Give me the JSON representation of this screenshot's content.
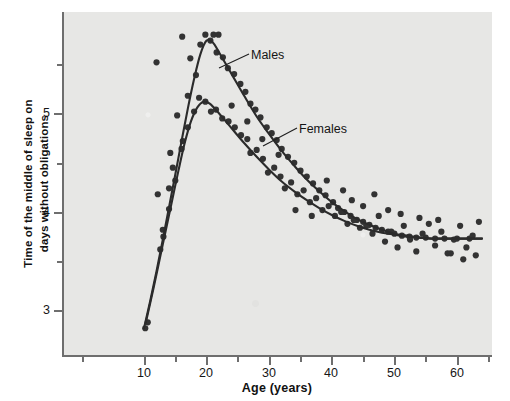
{
  "chart_data": {
    "type": "scatter",
    "title": "",
    "xlabel": "Age (years)",
    "ylabel": "Time of the middle of sleep on days without obligations",
    "xlim": [
      6,
      66
    ],
    "ylim": [
      2.6,
      6.0
    ],
    "xticks_major": [
      10,
      20,
      30,
      40,
      50,
      60
    ],
    "xticks_minor": [
      5,
      15,
      25,
      35,
      45,
      55,
      65
    ],
    "yticks_major": [
      3,
      4,
      5
    ],
    "yticks_minor": [
      3.5,
      4.5,
      5.5
    ],
    "grid": false,
    "legend_position": "inline-annotations",
    "annotations": [
      {
        "text": "Males",
        "x": 26.5,
        "y": 5.45
      },
      {
        "text": "Females",
        "x": 34.0,
        "y": 4.7
      }
    ],
    "series": [
      {
        "name": "Males",
        "fit_points": [
          {
            "x": 10.0,
            "y": 2.82
          },
          {
            "x": 11.0,
            "y": 3.1
          },
          {
            "x": 12.0,
            "y": 3.4
          },
          {
            "x": 13.0,
            "y": 3.72
          },
          {
            "x": 14.0,
            "y": 4.05
          },
          {
            "x": 15.0,
            "y": 4.38
          },
          {
            "x": 16.0,
            "y": 4.72
          },
          {
            "x": 17.0,
            "y": 5.05
          },
          {
            "x": 18.0,
            "y": 5.35
          },
          {
            "x": 19.0,
            "y": 5.6
          },
          {
            "x": 20.0,
            "y": 5.74
          },
          {
            "x": 21.0,
            "y": 5.72
          },
          {
            "x": 22.0,
            "y": 5.62
          },
          {
            "x": 24.0,
            "y": 5.4
          },
          {
            "x": 26.0,
            "y": 5.18
          },
          {
            "x": 28.0,
            "y": 4.97
          },
          {
            "x": 30.0,
            "y": 4.79
          },
          {
            "x": 32.0,
            "y": 4.62
          },
          {
            "x": 34.0,
            "y": 4.47
          },
          {
            "x": 36.0,
            "y": 4.33
          },
          {
            "x": 38.0,
            "y": 4.21
          },
          {
            "x": 40.0,
            "y": 4.1
          },
          {
            "x": 42.0,
            "y": 4.01
          },
          {
            "x": 44.0,
            "y": 3.93
          },
          {
            "x": 46.0,
            "y": 3.87
          },
          {
            "x": 48.0,
            "y": 3.82
          },
          {
            "x": 50.0,
            "y": 3.78
          },
          {
            "x": 52.0,
            "y": 3.76
          },
          {
            "x": 54.0,
            "y": 3.74
          },
          {
            "x": 56.0,
            "y": 3.73
          },
          {
            "x": 58.0,
            "y": 3.73
          },
          {
            "x": 60.0,
            "y": 3.73
          },
          {
            "x": 62.0,
            "y": 3.73
          },
          {
            "x": 64.0,
            "y": 3.73
          }
        ],
        "points": [
          {
            "x": 10.2,
            "y": 2.82
          },
          {
            "x": 10.6,
            "y": 2.88
          },
          {
            "x": 12.6,
            "y": 3.62
          },
          {
            "x": 13.1,
            "y": 3.75
          },
          {
            "x": 14.0,
            "y": 4.03
          },
          {
            "x": 14.0,
            "y": 4.24
          },
          {
            "x": 14.6,
            "y": 4.45
          },
          {
            "x": 15.3,
            "y": 4.98
          },
          {
            "x": 16.2,
            "y": 4.72
          },
          {
            "x": 17.0,
            "y": 5.18
          },
          {
            "x": 17.4,
            "y": 5.56
          },
          {
            "x": 18.3,
            "y": 5.39
          },
          {
            "x": 19.0,
            "y": 5.7
          },
          {
            "x": 19.8,
            "y": 5.8
          },
          {
            "x": 20.6,
            "y": 5.74
          },
          {
            "x": 21.1,
            "y": 5.8
          },
          {
            "x": 21.6,
            "y": 5.62
          },
          {
            "x": 22.6,
            "y": 5.57
          },
          {
            "x": 23.4,
            "y": 5.46
          },
          {
            "x": 24.4,
            "y": 5.4
          },
          {
            "x": 25.4,
            "y": 5.3
          },
          {
            "x": 26.2,
            "y": 5.22
          },
          {
            "x": 27.0,
            "y": 5.1
          },
          {
            "x": 27.8,
            "y": 5.04
          },
          {
            "x": 28.6,
            "y": 4.96
          },
          {
            "x": 29.6,
            "y": 4.86
          },
          {
            "x": 30.4,
            "y": 4.8
          },
          {
            "x": 31.2,
            "y": 4.73
          },
          {
            "x": 32.0,
            "y": 4.64
          },
          {
            "x": 33.0,
            "y": 4.56
          },
          {
            "x": 34.0,
            "y": 4.5
          },
          {
            "x": 35.0,
            "y": 4.42
          },
          {
            "x": 36.0,
            "y": 4.36
          },
          {
            "x": 37.0,
            "y": 4.29
          },
          {
            "x": 38.0,
            "y": 4.22
          },
          {
            "x": 39.0,
            "y": 4.17
          },
          {
            "x": 40.2,
            "y": 4.1
          },
          {
            "x": 41.0,
            "y": 4.04
          },
          {
            "x": 42.0,
            "y": 4.0
          },
          {
            "x": 43.0,
            "y": 3.96
          },
          {
            "x": 44.0,
            "y": 3.92
          },
          {
            "x": 45.0,
            "y": 3.9
          },
          {
            "x": 46.0,
            "y": 3.87
          },
          {
            "x": 47.0,
            "y": 3.84
          },
          {
            "x": 48.0,
            "y": 3.82
          },
          {
            "x": 49.0,
            "y": 3.8
          },
          {
            "x": 50.0,
            "y": 3.78
          },
          {
            "x": 51.2,
            "y": 3.76
          },
          {
            "x": 52.4,
            "y": 3.75
          },
          {
            "x": 53.5,
            "y": 3.74
          },
          {
            "x": 55.0,
            "y": 3.74
          },
          {
            "x": 56.5,
            "y": 3.73
          },
          {
            "x": 58.0,
            "y": 3.73
          },
          {
            "x": 60.0,
            "y": 3.73
          },
          {
            "x": 62.0,
            "y": 3.73
          }
        ]
      },
      {
        "name": "Females",
        "fit_points": [
          {
            "x": 10.3,
            "y": 2.88
          },
          {
            "x": 11.5,
            "y": 3.22
          },
          {
            "x": 12.5,
            "y": 3.52
          },
          {
            "x": 13.5,
            "y": 3.82
          },
          {
            "x": 14.5,
            "y": 4.12
          },
          {
            "x": 15.5,
            "y": 4.42
          },
          {
            "x": 16.5,
            "y": 4.7
          },
          {
            "x": 17.5,
            "y": 4.92
          },
          {
            "x": 18.5,
            "y": 5.06
          },
          {
            "x": 19.5,
            "y": 5.12
          },
          {
            "x": 20.5,
            "y": 5.1
          },
          {
            "x": 22.0,
            "y": 5.0
          },
          {
            "x": 24.0,
            "y": 4.85
          },
          {
            "x": 26.0,
            "y": 4.7
          },
          {
            "x": 28.0,
            "y": 4.56
          },
          {
            "x": 30.0,
            "y": 4.43
          },
          {
            "x": 32.0,
            "y": 4.31
          },
          {
            "x": 34.0,
            "y": 4.21
          },
          {
            "x": 36.0,
            "y": 4.12
          },
          {
            "x": 38.0,
            "y": 4.04
          },
          {
            "x": 40.0,
            "y": 3.97
          },
          {
            "x": 42.0,
            "y": 3.91
          },
          {
            "x": 44.0,
            "y": 3.86
          },
          {
            "x": 46.0,
            "y": 3.82
          },
          {
            "x": 48.0,
            "y": 3.79
          },
          {
            "x": 50.0,
            "y": 3.77
          },
          {
            "x": 52.0,
            "y": 3.75
          },
          {
            "x": 54.0,
            "y": 3.74
          },
          {
            "x": 56.0,
            "y": 3.73
          },
          {
            "x": 58.0,
            "y": 3.73
          },
          {
            "x": 60.0,
            "y": 3.73
          },
          {
            "x": 62.0,
            "y": 3.73
          },
          {
            "x": 64.0,
            "y": 3.73
          }
        ],
        "points": [
          {
            "x": 12.2,
            "y": 4.18
          },
          {
            "x": 13.0,
            "y": 3.82
          },
          {
            "x": 14.2,
            "y": 4.6
          },
          {
            "x": 15.0,
            "y": 4.32
          },
          {
            "x": 16.0,
            "y": 4.64
          },
          {
            "x": 17.0,
            "y": 4.86
          },
          {
            "x": 18.0,
            "y": 5.02
          },
          {
            "x": 18.8,
            "y": 5.16
          },
          {
            "x": 19.8,
            "y": 5.12
          },
          {
            "x": 20.7,
            "y": 5.02
          },
          {
            "x": 21.5,
            "y": 5.04
          },
          {
            "x": 22.5,
            "y": 4.95
          },
          {
            "x": 23.5,
            "y": 4.92
          },
          {
            "x": 24.5,
            "y": 4.86
          },
          {
            "x": 25.5,
            "y": 4.78
          },
          {
            "x": 26.5,
            "y": 4.74
          },
          {
            "x": 27.0,
            "y": 4.6
          },
          {
            "x": 28.0,
            "y": 4.63
          },
          {
            "x": 29.0,
            "y": 4.54
          },
          {
            "x": 29.8,
            "y": 4.4
          },
          {
            "x": 30.8,
            "y": 4.45
          },
          {
            "x": 31.8,
            "y": 4.36
          },
          {
            "x": 32.5,
            "y": 4.24
          },
          {
            "x": 33.5,
            "y": 4.3
          },
          {
            "x": 34.5,
            "y": 4.18
          },
          {
            "x": 35.5,
            "y": 4.22
          },
          {
            "x": 36.5,
            "y": 4.1
          },
          {
            "x": 37.5,
            "y": 4.14
          },
          {
            "x": 38.5,
            "y": 4.02
          },
          {
            "x": 39.5,
            "y": 4.06
          },
          {
            "x": 40.5,
            "y": 3.96
          },
          {
            "x": 41.5,
            "y": 4.0
          },
          {
            "x": 42.5,
            "y": 3.88
          },
          {
            "x": 43.5,
            "y": 3.92
          },
          {
            "x": 44.5,
            "y": 3.84
          },
          {
            "x": 45.5,
            "y": 3.86
          },
          {
            "x": 46.5,
            "y": 3.78
          },
          {
            "x": 47.5,
            "y": 3.96
          },
          {
            "x": 48.5,
            "y": 3.7
          },
          {
            "x": 49.5,
            "y": 3.8
          },
          {
            "x": 50.5,
            "y": 3.64
          },
          {
            "x": 51.5,
            "y": 3.86
          },
          {
            "x": 52.5,
            "y": 3.72
          },
          {
            "x": 53.5,
            "y": 3.6
          },
          {
            "x": 54.5,
            "y": 3.78
          },
          {
            "x": 55.5,
            "y": 3.88
          },
          {
            "x": 56.5,
            "y": 3.66
          },
          {
            "x": 57.5,
            "y": 3.8
          },
          {
            "x": 58.5,
            "y": 3.58
          },
          {
            "x": 59.5,
            "y": 3.72
          },
          {
            "x": 60.5,
            "y": 3.86
          },
          {
            "x": 61.5,
            "y": 3.64
          },
          {
            "x": 62.5,
            "y": 3.76
          },
          {
            "x": 63.0,
            "y": 3.56
          }
        ]
      }
    ],
    "extra_scatter": [
      {
        "x": 12.0,
        "y": 5.52
      },
      {
        "x": 16.1,
        "y": 5.78
      },
      {
        "x": 21.9,
        "y": 5.8
      },
      {
        "x": 24.0,
        "y": 5.08
      },
      {
        "x": 26.5,
        "y": 4.92
      },
      {
        "x": 28.9,
        "y": 4.74
      },
      {
        "x": 31.5,
        "y": 4.58
      },
      {
        "x": 34.2,
        "y": 4.02
      },
      {
        "x": 36.8,
        "y": 3.96
      },
      {
        "x": 39.2,
        "y": 4.32
      },
      {
        "x": 41.8,
        "y": 4.22
      },
      {
        "x": 43.2,
        "y": 4.12
      },
      {
        "x": 45.0,
        "y": 4.06
      },
      {
        "x": 46.8,
        "y": 4.18
      },
      {
        "x": 49.0,
        "y": 4.02
      },
      {
        "x": 51.0,
        "y": 3.98
      },
      {
        "x": 54.0,
        "y": 3.94
      },
      {
        "x": 57.0,
        "y": 3.92
      },
      {
        "x": 59.0,
        "y": 3.58
      },
      {
        "x": 61.0,
        "y": 3.52
      },
      {
        "x": 63.5,
        "y": 3.9
      }
    ]
  },
  "axis": {
    "x_title": "Age (years)",
    "y_title_line1": "Time of the middle of sleep on",
    "y_title_line2": "days without obligations",
    "x_tick_labels": [
      "10",
      "20",
      "30",
      "40",
      "50",
      "60"
    ],
    "y_tick_labels": [
      "5",
      "4",
      "3"
    ]
  },
  "labels": {
    "males": "Males",
    "females": "Females"
  },
  "colors": {
    "panel_background": "#e7e7e5",
    "page_background": "#ffffff",
    "curve": "#2b2b2b",
    "point": "#333333",
    "axis": "#6e6e6e",
    "text": "#141414"
  }
}
